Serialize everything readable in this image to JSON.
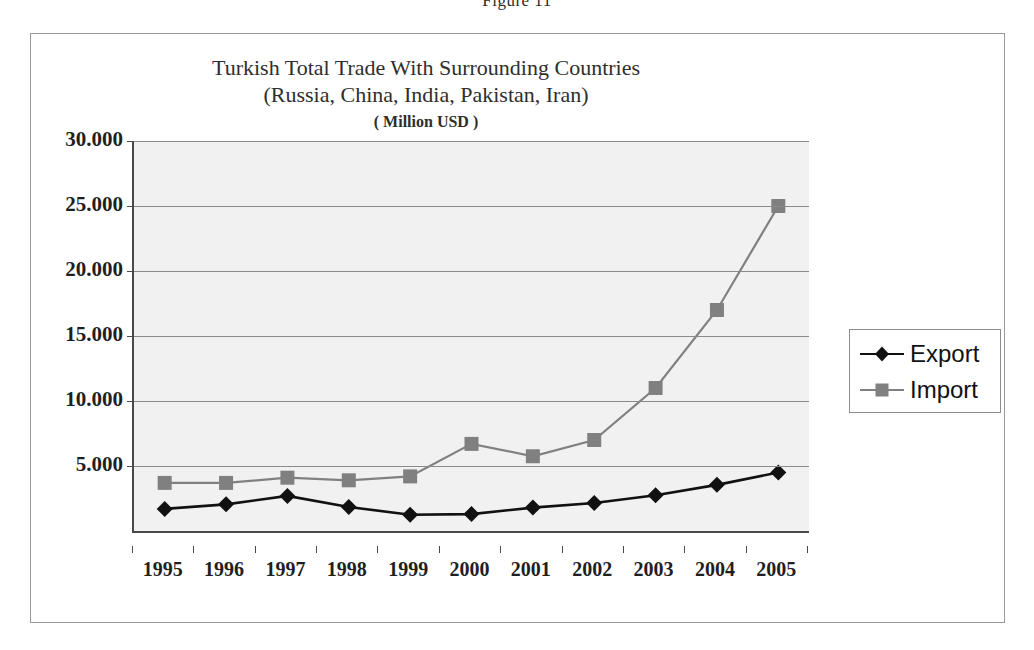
{
  "figure": {
    "caption": "Figure 11"
  },
  "chart_data": {
    "type": "line",
    "title": "Turkish Total Trade With Surrounding Countries",
    "title_line2": "(Russia, China, India, Pakistan, Iran)",
    "subtitle": "( Million USD )",
    "xlabel": "",
    "ylabel": "",
    "unit": "Million USD",
    "categories": [
      "1995",
      "1996",
      "1997",
      "1998",
      "1999",
      "2000",
      "2001",
      "2002",
      "2003",
      "2004",
      "2005"
    ],
    "x": [
      1995,
      1996,
      1997,
      1998,
      1999,
      2000,
      2001,
      2002,
      2003,
      2004,
      2005
    ],
    "ylim": [
      0,
      30000
    ],
    "ytick_values": [
      5000,
      10000,
      15000,
      20000,
      25000,
      30000
    ],
    "ytick_labels": [
      "5.000",
      "10.000",
      "15.000",
      "20.000",
      "25.000",
      "30.000"
    ],
    "grid": true,
    "legend_position": "right",
    "series": [
      {
        "name": "Export",
        "color": "#111111",
        "marker": "diamond",
        "values": [
          1700,
          2050,
          2700,
          1850,
          1250,
          1300,
          1800,
          2150,
          2750,
          3550,
          4500
        ]
      },
      {
        "name": "Import",
        "color": "#808080",
        "marker": "square",
        "values": [
          3700,
          3700,
          4100,
          3900,
          4200,
          6700,
          5750,
          7000,
          11000,
          17000,
          25000
        ]
      }
    ]
  },
  "legend": {
    "items": [
      {
        "label": "Export",
        "marker": "diamond",
        "color": "#111111"
      },
      {
        "label": "Import",
        "marker": "square",
        "color": "#808080"
      }
    ]
  }
}
